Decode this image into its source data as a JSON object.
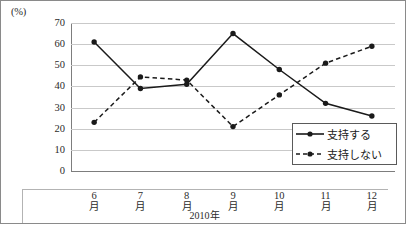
{
  "chart_data": {
    "type": "line",
    "title": "",
    "subtitle": "",
    "xlabel": "2010年",
    "ylabel": "",
    "unit_label": "(%)",
    "categories": [
      "6月",
      "7月",
      "8月",
      "9月",
      "10月",
      "11月",
      "12月"
    ],
    "category_lines": [
      {
        "top": "6",
        "bottom": "月"
      },
      {
        "top": "7",
        "bottom": "月"
      },
      {
        "top": "8",
        "bottom": "月"
      },
      {
        "top": "9",
        "bottom": "月"
      },
      {
        "top": "10",
        "bottom": "月"
      },
      {
        "top": "11",
        "bottom": "月"
      },
      {
        "top": "12",
        "bottom": "月"
      }
    ],
    "ylim": [
      0,
      70
    ],
    "ystep": 10,
    "yticks": [
      "70",
      "60",
      "50",
      "40",
      "30",
      "20",
      "10",
      "0"
    ],
    "grid": true,
    "legend_position": "bottom-right",
    "series": [
      {
        "name": "支持する",
        "style": "solid",
        "marker": "circle",
        "color": "#1a1a1a",
        "values": [
          61,
          39,
          41,
          65,
          48,
          32,
          26
        ]
      },
      {
        "name": "支持しない",
        "style": "dashed",
        "marker": "circle",
        "color": "#1a1a1a",
        "values": [
          23,
          44.5,
          43,
          21,
          36,
          51,
          59
        ]
      }
    ]
  }
}
